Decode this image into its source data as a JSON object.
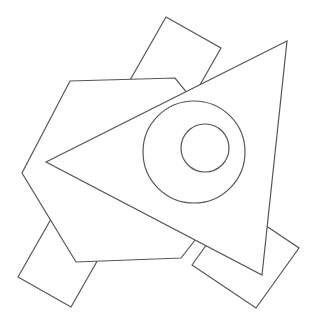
{
  "canvas": {
    "width": 320,
    "height": 329,
    "background": "#ffffff",
    "stroke_color": "#555555"
  },
  "shapes": {
    "top_rectangle": {
      "points": "166,17 221,48 176,127 121,96"
    },
    "bottom_left_rectangle": {
      "points": "18,277 71,307 112,235 59,205"
    },
    "hexagon": {
      "points": "70,81 175,78 250,170 181,258 76,262 22,173"
    },
    "bottom_right_rectangle": {
      "points": "192,265 256,308 299,248 235,205"
    },
    "triangle": {
      "points": "287,41 46,162 262,275"
    },
    "outer_circle": {
      "cx": 194,
      "cy": 152,
      "r": 51
    },
    "inner_circle": {
      "cx": 205,
      "cy": 148,
      "r": 24
    }
  }
}
